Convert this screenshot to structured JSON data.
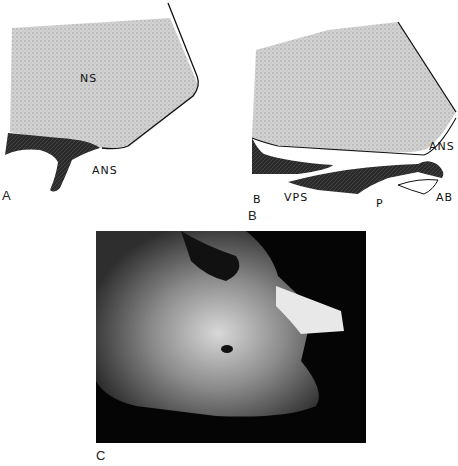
{
  "figure": {
    "panels": [
      {
        "id": "A",
        "label": "A",
        "annotations": {
          "ns": "NS",
          "ans": "ANS"
        }
      },
      {
        "id": "B",
        "label": "B",
        "annotations": {
          "b": "B",
          "vps": "VPS",
          "p": "P",
          "ans": "ANS",
          "ab": "AB"
        }
      },
      {
        "id": "C",
        "label": "C",
        "description": "Photograph of skull specimen"
      }
    ]
  }
}
